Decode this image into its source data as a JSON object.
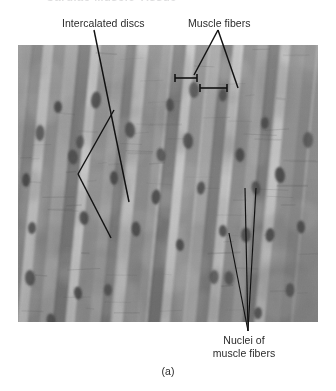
{
  "figure": {
    "caption": "(a)",
    "top_cutoff_text": "Cardiac Muscle Tissue",
    "plate": {
      "x": 18,
      "y": 45,
      "width": 300,
      "height": 277,
      "description": "light micrograph of cardiac muscle, longitudinal section",
      "base_color": "#8c8c8c",
      "light_color": "#d8d8d8",
      "dark_color": "#4a4a4a",
      "nucleus_color": "#3a3a3a"
    }
  },
  "annotations": [
    {
      "id": "intercalated-discs",
      "label": "Intercalated discs",
      "label_x": 62,
      "label_y": 17,
      "leader_color": "#111111",
      "leader_width": 1.4
    },
    {
      "id": "muscle-fibers",
      "label": "Muscle fibers",
      "label_x": 188,
      "label_y": 17,
      "leader_color": "#111111",
      "leader_width": 1.4
    },
    {
      "id": "nuclei-of-muscle-fibers",
      "label_line_1": "Nuclei of",
      "label_line_2": "muscle fibers",
      "label_x": 196,
      "label_y": 334,
      "leader_color": "#111111",
      "leader_width": 1.2
    }
  ],
  "leader_paths": {
    "intercalated_main": "M 94,30 L 129,202",
    "intercalated_branch_upper": "M 114,110 L 78,174",
    "intercalated_branch_lower": "M 78,174 L 111,238",
    "muscle_fibers_apex": "M 218,30 L 194,75",
    "muscle_fibers_right": "M 218,30 L 238,88",
    "bracket_left": "M 175,78 L 197,78",
    "bracket_left_cap_a": "M 175,74 L 175,82",
    "bracket_left_cap_b": "M 197,74 L 197,82",
    "bracket_right": "M 200,88 L 227,88",
    "bracket_right_cap_a": "M 200,84 L 200,92",
    "bracket_right_cap_b": "M 227,84 L 227,92",
    "nuclei_left": "M 229,233 L 248,331",
    "nuclei_mid": "M 245,188 L 248,331",
    "nuclei_right": "M 256,188 L 248,331"
  },
  "micrograph_features": {
    "fiber_bands": [
      {
        "x": 0,
        "w": 16,
        "tone": "#9a9a9a",
        "skew": -3
      },
      {
        "x": 14,
        "w": 13,
        "tone": "#7e7e7e",
        "skew": -3
      },
      {
        "x": 26,
        "w": 11,
        "tone": "#c4c4c4",
        "skew": -3
      },
      {
        "x": 36,
        "w": 15,
        "tone": "#8a8a8a",
        "skew": -3
      },
      {
        "x": 50,
        "w": 12,
        "tone": "#a6a6a6",
        "skew": -3
      },
      {
        "x": 61,
        "w": 14,
        "tone": "#747474",
        "skew": -3
      },
      {
        "x": 74,
        "w": 10,
        "tone": "#cfcfcf",
        "skew": -3
      },
      {
        "x": 83,
        "w": 16,
        "tone": "#8f8f8f",
        "skew": -3
      },
      {
        "x": 98,
        "w": 12,
        "tone": "#a2a2a2",
        "skew": -3
      },
      {
        "x": 109,
        "w": 13,
        "tone": "#787878",
        "skew": -3
      },
      {
        "x": 121,
        "w": 11,
        "tone": "#c8c8c8",
        "skew": -3
      },
      {
        "x": 131,
        "w": 15,
        "tone": "#8d8d8d",
        "skew": -3
      },
      {
        "x": 145,
        "w": 12,
        "tone": "#9e9e9e",
        "skew": -3
      },
      {
        "x": 156,
        "w": 14,
        "tone": "#727272",
        "skew": -3
      },
      {
        "x": 169,
        "w": 10,
        "tone": "#d2d2d2",
        "skew": -3
      },
      {
        "x": 178,
        "w": 16,
        "tone": "#949494",
        "skew": -3
      },
      {
        "x": 193,
        "w": 12,
        "tone": "#a8a8a8",
        "skew": -3
      },
      {
        "x": 204,
        "w": 13,
        "tone": "#7a7a7a",
        "skew": -3
      },
      {
        "x": 216,
        "w": 11,
        "tone": "#cacaca",
        "skew": -3
      },
      {
        "x": 226,
        "w": 15,
        "tone": "#8b8b8b",
        "skew": -3
      },
      {
        "x": 240,
        "w": 12,
        "tone": "#a0a0a0",
        "skew": -3
      },
      {
        "x": 251,
        "w": 14,
        "tone": "#767676",
        "skew": -3
      },
      {
        "x": 264,
        "w": 10,
        "tone": "#cdcdcd",
        "skew": -3
      },
      {
        "x": 273,
        "w": 16,
        "tone": "#929292",
        "skew": -3
      },
      {
        "x": 288,
        "w": 14,
        "tone": "#828282",
        "skew": -3
      }
    ],
    "nuclei": [
      {
        "cx": 22,
        "cy": 88,
        "rx": 4.5,
        "ry": 8
      },
      {
        "cx": 8,
        "cy": 135,
        "rx": 4,
        "ry": 7
      },
      {
        "cx": 55,
        "cy": 112,
        "rx": 5,
        "ry": 7.5
      },
      {
        "cx": 40,
        "cy": 62,
        "rx": 4,
        "ry": 6
      },
      {
        "cx": 78,
        "cy": 55,
        "rx": 5,
        "ry": 8.5
      },
      {
        "cx": 62,
        "cy": 97,
        "rx": 4,
        "ry": 6.5
      },
      {
        "cx": 66,
        "cy": 173,
        "rx": 4.5,
        "ry": 7
      },
      {
        "cx": 14,
        "cy": 183,
        "rx": 4,
        "ry": 6
      },
      {
        "cx": 12,
        "cy": 233,
        "rx": 5,
        "ry": 8
      },
      {
        "cx": 33,
        "cy": 275,
        "rx": 4.5,
        "ry": 6.5
      },
      {
        "cx": 96,
        "cy": 133,
        "rx": 4,
        "ry": 7
      },
      {
        "cx": 112,
        "cy": 85,
        "rx": 5,
        "ry": 8
      },
      {
        "cx": 118,
        "cy": 184,
        "rx": 4.5,
        "ry": 7.5
      },
      {
        "cx": 90,
        "cy": 245,
        "rx": 4,
        "ry": 6
      },
      {
        "cx": 143,
        "cy": 110,
        "rx": 4.5,
        "ry": 7
      },
      {
        "cx": 152,
        "cy": 60,
        "rx": 4,
        "ry": 6.5
      },
      {
        "cx": 138,
        "cy": 152,
        "rx": 4.5,
        "ry": 7.5
      },
      {
        "cx": 162,
        "cy": 200,
        "rx": 4,
        "ry": 6
      },
      {
        "cx": 170,
        "cy": 96,
        "rx": 5,
        "ry": 8
      },
      {
        "cx": 183,
        "cy": 143,
        "rx": 4,
        "ry": 6.5
      },
      {
        "cx": 196,
        "cy": 232,
        "rx": 4.5,
        "ry": 7
      },
      {
        "cx": 205,
        "cy": 186,
        "rx": 4,
        "ry": 6
      },
      {
        "cx": 211,
        "cy": 233,
        "rx": 4.5,
        "ry": 7
      },
      {
        "cx": 228,
        "cy": 190,
        "rx": 5,
        "ry": 7.5
      },
      {
        "cx": 238,
        "cy": 143,
        "rx": 4.5,
        "ry": 7
      },
      {
        "cx": 205,
        "cy": 50,
        "rx": 4,
        "ry": 6.5
      },
      {
        "cx": 176,
        "cy": 45,
        "rx": 5,
        "ry": 8
      },
      {
        "cx": 222,
        "cy": 110,
        "rx": 4.5,
        "ry": 7
      },
      {
        "cx": 247,
        "cy": 78,
        "rx": 4,
        "ry": 6
      },
      {
        "cx": 262,
        "cy": 130,
        "rx": 5,
        "ry": 8
      },
      {
        "cx": 252,
        "cy": 190,
        "rx": 4.5,
        "ry": 7
      },
      {
        "cx": 283,
        "cy": 182,
        "rx": 4,
        "ry": 6.5
      },
      {
        "cx": 290,
        "cy": 95,
        "rx": 5,
        "ry": 8
      },
      {
        "cx": 272,
        "cy": 245,
        "rx": 4.5,
        "ry": 7
      },
      {
        "cx": 240,
        "cy": 268,
        "rx": 4,
        "ry": 6
      },
      {
        "cx": 196,
        "cy": 288,
        "rx": 4.5,
        "ry": 7
      },
      {
        "cx": 120,
        "cy": 298,
        "rx": 4,
        "ry": 6
      },
      {
        "cx": 60,
        "cy": 248,
        "rx": 4,
        "ry": 6.5
      }
    ]
  }
}
